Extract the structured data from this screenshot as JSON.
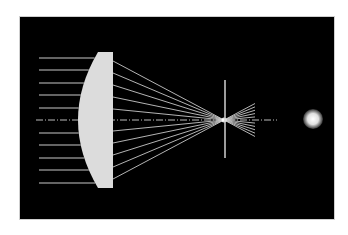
{
  "diagram": {
    "type": "optical ray diagram",
    "colors": {
      "background": "#000000",
      "frame": "#ffffff",
      "lens": "#dcdcdc",
      "rays": "#c8c8c8",
      "axis": "#bbbbbb",
      "screen": "#d0d0d0",
      "spot": "#ffffff"
    },
    "lens": {
      "flat_x": 113,
      "top": 52,
      "bottom": 188,
      "vertex_x": 78,
      "edge_x": 98
    },
    "incoming_rays_y": [
      58,
      70,
      83,
      95,
      108,
      133,
      145,
      158,
      170,
      183
    ],
    "exit_rays_y": [
      61,
      73,
      85,
      97,
      109,
      131,
      143,
      155,
      167,
      179
    ],
    "focus": {
      "x": 224,
      "y": 120
    },
    "screen": {
      "x": 225,
      "top": 80,
      "bottom": 158
    },
    "fan_end_x": 255,
    "axis": {
      "y": 120,
      "x1": 36,
      "x2": 277
    },
    "spot": {
      "cx": 313,
      "cy": 119,
      "r": 10
    }
  }
}
